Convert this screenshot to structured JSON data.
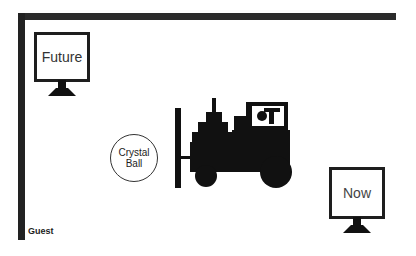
{
  "diagram": {
    "monitors": [
      {
        "id": "future",
        "label": "Future"
      },
      {
        "id": "now",
        "label": "Now"
      }
    ],
    "crystal_ball": {
      "line1": "Crystal",
      "line2": "Ball"
    },
    "forklift": {
      "icon": "forklift-icon"
    },
    "corner_label": "Guest",
    "colors": {
      "ink": "#1e1e1e",
      "background": "#ffffff",
      "frame": "#2b2b2b"
    }
  }
}
